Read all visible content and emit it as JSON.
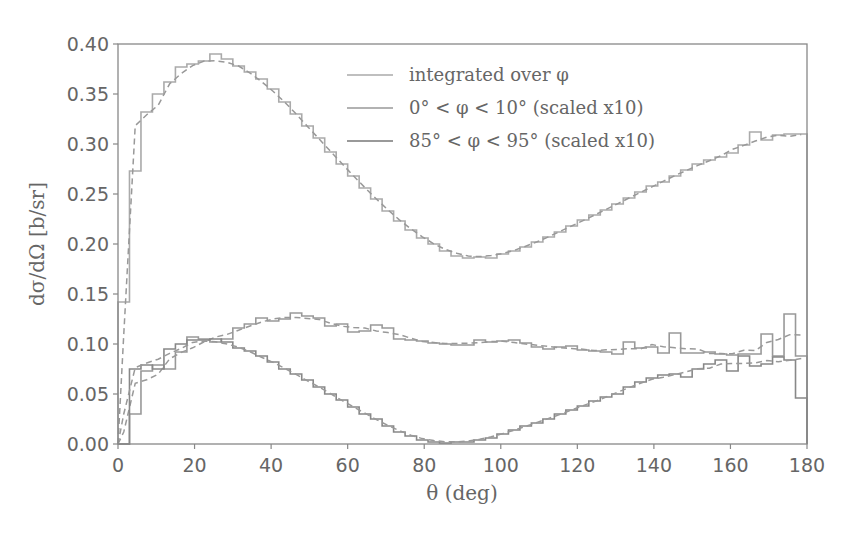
{
  "chart_data": {
    "type": "line",
    "title": "",
    "xlabel": "θ (deg)",
    "ylabel": "dσ/dΩ [b/sr]",
    "xlim": [
      0,
      180
    ],
    "ylim": [
      0,
      0.4
    ],
    "xticks": [
      0,
      20,
      40,
      60,
      80,
      100,
      120,
      140,
      160,
      180
    ],
    "xtick_labels": [
      "0",
      "20",
      "40",
      "60",
      "80",
      "100",
      "120",
      "140",
      "160",
      "180"
    ],
    "yticks": [
      0.0,
      0.05,
      0.1,
      0.15,
      0.2,
      0.25,
      0.3,
      0.35,
      0.4
    ],
    "ytick_labels": [
      "0.00",
      "0.05",
      "0.10",
      "0.15",
      "0.20",
      "0.25",
      "0.30",
      "0.35",
      "0.40"
    ],
    "grid": false,
    "legend_position": "upper right",
    "bin_width_deg": 3,
    "series": [
      {
        "name": "integrated over φ",
        "style": "step histogram + dashed model",
        "bin_values": [
          0.142,
          0.273,
          0.332,
          0.35,
          0.362,
          0.377,
          0.38,
          0.383,
          0.39,
          0.385,
          0.378,
          0.372,
          0.365,
          0.355,
          0.342,
          0.33,
          0.318,
          0.306,
          0.292,
          0.28,
          0.268,
          0.256,
          0.245,
          0.233,
          0.223,
          0.214,
          0.206,
          0.2,
          0.193,
          0.188,
          0.186,
          0.187,
          0.186,
          0.19,
          0.193,
          0.197,
          0.202,
          0.207,
          0.212,
          0.218,
          0.224,
          0.229,
          0.234,
          0.24,
          0.246,
          0.252,
          0.258,
          0.262,
          0.268,
          0.274,
          0.28,
          0.284,
          0.287,
          0.291,
          0.299,
          0.312,
          0.304,
          0.309,
          0.31,
          0.31
        ]
      },
      {
        "name": "0° < φ < 10° (scaled x10)",
        "style": "step histogram + dashed model",
        "bin_values": [
          0.0,
          0.03,
          0.073,
          0.079,
          0.075,
          0.092,
          0.107,
          0.105,
          0.102,
          0.105,
          0.116,
          0.12,
          0.126,
          0.123,
          0.125,
          0.131,
          0.128,
          0.126,
          0.118,
          0.12,
          0.112,
          0.113,
          0.119,
          0.116,
          0.105,
          0.104,
          0.103,
          0.101,
          0.1,
          0.099,
          0.099,
          0.104,
          0.102,
          0.103,
          0.104,
          0.101,
          0.097,
          0.095,
          0.097,
          0.098,
          0.094,
          0.093,
          0.092,
          0.09,
          0.102,
          0.096,
          0.097,
          0.091,
          0.111,
          0.091,
          0.091,
          0.092,
          0.09,
          0.089,
          0.09,
          0.09,
          0.11,
          0.088,
          0.13,
          0.088
        ]
      },
      {
        "name": "85° < φ < 95° (scaled x10)",
        "style": "step histogram + dashed model",
        "bin_values": [
          0.0,
          0.075,
          0.079,
          0.075,
          0.095,
          0.1,
          0.104,
          0.104,
          0.105,
          0.102,
          0.096,
          0.093,
          0.088,
          0.082,
          0.075,
          0.07,
          0.064,
          0.057,
          0.05,
          0.044,
          0.037,
          0.03,
          0.025,
          0.018,
          0.012,
          0.008,
          0.004,
          0.002,
          0.001,
          0.002,
          0.002,
          0.004,
          0.006,
          0.01,
          0.014,
          0.018,
          0.021,
          0.025,
          0.03,
          0.034,
          0.038,
          0.043,
          0.047,
          0.05,
          0.057,
          0.062,
          0.066,
          0.069,
          0.07,
          0.067,
          0.075,
          0.08,
          0.084,
          0.073,
          0.088,
          0.078,
          0.08,
          0.087,
          0.084,
          0.046
        ]
      }
    ],
    "colors": {
      "series": "#888888",
      "axes": "#777777",
      "text": "#666666"
    }
  },
  "legend": {
    "items": [
      {
        "label": "integrated over φ"
      },
      {
        "label": "0° < φ < 10° (scaled x10)"
      },
      {
        "label": "85° < φ < 95° (scaled x10)"
      }
    ]
  }
}
